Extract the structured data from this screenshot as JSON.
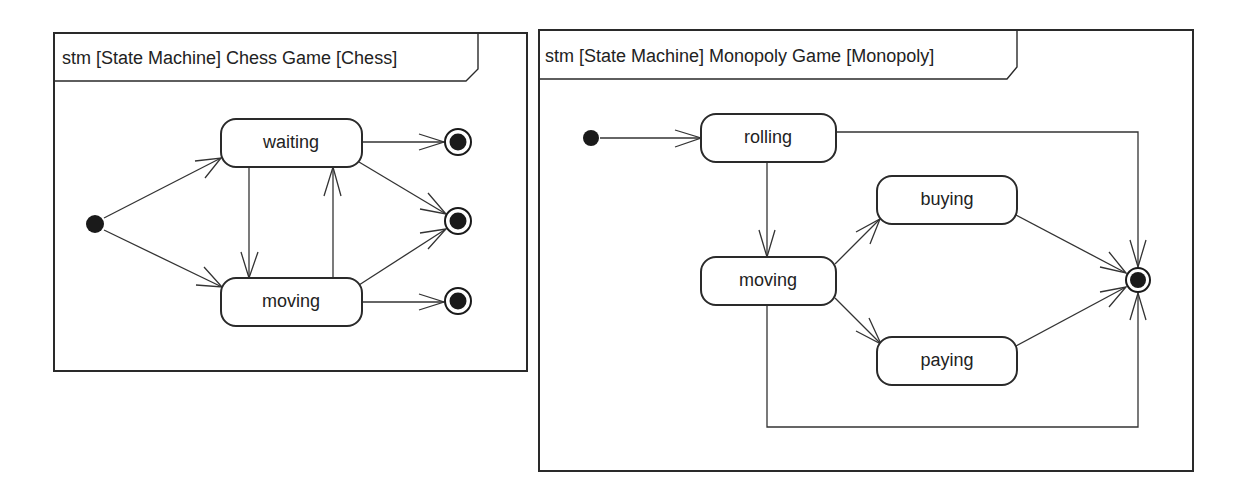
{
  "diagrams": [
    {
      "id": "chess",
      "title": "stm [State Machine] Chess Game [Chess]",
      "states": [
        {
          "name": "waiting",
          "label": "waiting"
        },
        {
          "name": "moving",
          "label": "moving"
        }
      ],
      "initial_states": 1,
      "final_states": 3,
      "transitions": [
        {
          "from": "initial",
          "to": "waiting"
        },
        {
          "from": "initial",
          "to": "moving"
        },
        {
          "from": "waiting",
          "to": "moving"
        },
        {
          "from": "moving",
          "to": "waiting"
        },
        {
          "from": "waiting",
          "to": "final-1"
        },
        {
          "from": "waiting",
          "to": "final-2"
        },
        {
          "from": "moving",
          "to": "final-2"
        },
        {
          "from": "moving",
          "to": "final-3"
        }
      ]
    },
    {
      "id": "monopoly",
      "title": "stm [State Machine] Monopoly Game [Monopoly]",
      "states": [
        {
          "name": "rolling",
          "label": "rolling"
        },
        {
          "name": "moving",
          "label": "moving"
        },
        {
          "name": "buying",
          "label": "buying"
        },
        {
          "name": "paying",
          "label": "paying"
        }
      ],
      "initial_states": 1,
      "final_states": 1,
      "transitions": [
        {
          "from": "initial",
          "to": "rolling"
        },
        {
          "from": "rolling",
          "to": "moving"
        },
        {
          "from": "rolling",
          "to": "final"
        },
        {
          "from": "moving",
          "to": "buying"
        },
        {
          "from": "moving",
          "to": "paying"
        },
        {
          "from": "moving",
          "to": "final"
        },
        {
          "from": "buying",
          "to": "final"
        },
        {
          "from": "paying",
          "to": "final"
        }
      ]
    }
  ]
}
